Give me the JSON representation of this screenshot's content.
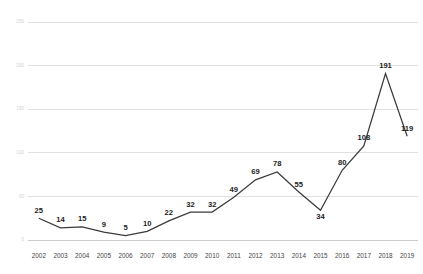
{
  "chart_data": {
    "type": "line",
    "title": "",
    "subtitle": "",
    "xlabel": "",
    "ylabel": "",
    "categories": [
      "2002",
      "2003",
      "2004",
      "2005",
      "2006",
      "2007",
      "2008",
      "2009",
      "2010",
      "2011",
      "2012",
      "2013",
      "2014",
      "2015",
      "2016",
      "2017",
      "2018",
      "2019"
    ],
    "values": [
      25,
      14,
      15,
      9,
      5,
      10,
      22,
      32,
      32,
      49,
      69,
      78,
      55,
      34,
      80,
      108,
      191,
      119
    ],
    "series": [
      {
        "name": "",
        "values": [
          25,
          14,
          15,
          9,
          5,
          10,
          22,
          32,
          32,
          49,
          69,
          78,
          55,
          34,
          80,
          108,
          191,
          119
        ]
      }
    ],
    "data_labels": [
      "25",
      "14",
      "15",
      "9",
      "5",
      "10",
      "22",
      "32",
      "32",
      "49",
      "69",
      "78",
      "55",
      "34",
      "80",
      "108",
      "191",
      "119"
    ],
    "label_positions": [
      "above",
      "above",
      "above",
      "above",
      "above",
      "above",
      "above",
      "above",
      "above",
      "above",
      "above",
      "above",
      "above",
      "below",
      "above",
      "above",
      "above",
      "above"
    ],
    "ylim": [
      0,
      250
    ],
    "yticks": [
      0,
      50,
      100,
      150,
      200,
      250
    ],
    "ytick_labels": [
      "0",
      "50",
      "100",
      "150",
      "200",
      "250"
    ],
    "grid": true,
    "grid_axis": "y",
    "legend": false,
    "legend_position": "none",
    "line_color": "#3b3b3b",
    "grid_color": "#d9d9d9",
    "label_color": "#1d1d1d",
    "ytick_color": "#d2d2d2",
    "xtick_color": "#3f3f3f",
    "background": "#ffffff",
    "markers": false
  }
}
